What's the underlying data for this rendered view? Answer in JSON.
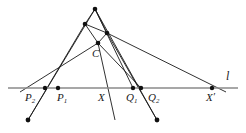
{
  "figure": {
    "kind": "projective-geometry-diagram",
    "width": 246,
    "height": 133,
    "background_color": "#ffffff",
    "stroke_color": "#1a1a1a",
    "axis_color": "#8a8a8a",
    "point_color": "#111111"
  },
  "labels": {
    "p2": {
      "base": "P",
      "sub": "2"
    },
    "p1": {
      "base": "P",
      "sub": "1"
    },
    "x": {
      "base": "X",
      "prime": ""
    },
    "q1": {
      "base": "Q",
      "sub": "1"
    },
    "q2": {
      "base": "Q",
      "sub": "2"
    },
    "x_prime": {
      "base": "X",
      "prime": "′"
    },
    "c": {
      "base": "C"
    },
    "line_l": {
      "base": "l"
    }
  },
  "points": [
    {
      "name": "apex",
      "x": 95,
      "y": 9,
      "labeled": false
    },
    {
      "name": "upper-left-node",
      "x": 85,
      "y": 24,
      "labeled": false
    },
    {
      "name": "right-node",
      "x": 107,
      "y": 33,
      "labeled": false
    },
    {
      "name": "center-c",
      "x": 98,
      "y": 43,
      "labeled": true,
      "label": "C"
    },
    {
      "name": "point-p2",
      "x": 45,
      "y": 88,
      "labeled": true,
      "label": "P2"
    },
    {
      "name": "point-p1",
      "x": 58,
      "y": 88,
      "labeled": true,
      "label": "P1"
    },
    {
      "name": "point-x",
      "x": 107,
      "y": 88,
      "labeled": true,
      "label": "X"
    },
    {
      "name": "point-q1",
      "x": 133,
      "y": 88,
      "labeled": true,
      "label": "Q1"
    },
    {
      "name": "point-q2",
      "x": 141,
      "y": 88,
      "labeled": true,
      "label": "Q2"
    },
    {
      "name": "point-x-prime",
      "x": 212,
      "y": 88,
      "labeled": true,
      "label": "X'"
    },
    {
      "name": "lower-left-vertex",
      "x": 28,
      "y": 120,
      "labeled": false
    },
    {
      "name": "lower-right-vertex",
      "x": 157,
      "y": 120,
      "labeled": false
    }
  ],
  "segments": [
    {
      "name": "apex-to-lower-left",
      "x1": 95,
      "y1": 9,
      "x2": 28,
      "y2": 120
    },
    {
      "name": "apex-to-lower-right",
      "x1": 95,
      "y1": 9,
      "x2": 157,
      "y2": 120
    },
    {
      "name": "apex-to-right-node",
      "x1": 95,
      "y1": 9,
      "x2": 107,
      "y2": 33
    },
    {
      "name": "apex-to-upper-left-node",
      "x1": 95,
      "y1": 9,
      "x2": 85,
      "y2": 24
    },
    {
      "name": "apex-to-q1",
      "x1": 95,
      "y1": 9,
      "x2": 133,
      "y2": 88
    },
    {
      "name": "upper-left-node-to-center",
      "x1": 85,
      "y1": 24,
      "x2": 98,
      "y2": 43
    },
    {
      "name": "upper-left-node-to-right-node",
      "x1": 85,
      "y1": 24,
      "x2": 107,
      "y2": 33
    },
    {
      "name": "upper-left-node-to-lower-left",
      "x1": 85,
      "y1": 24,
      "x2": 28,
      "y2": 120
    },
    {
      "name": "right-node-to-center",
      "x1": 107,
      "y1": 33,
      "x2": 98,
      "y2": 43
    },
    {
      "name": "right-node-to-lower-right",
      "x1": 107,
      "y1": 33,
      "x2": 157,
      "y2": 120
    },
    {
      "name": "right-node-to-x-prime",
      "x1": 107,
      "y1": 33,
      "x2": 226,
      "y2": 92
    },
    {
      "name": "center-to-p1",
      "x1": 98,
      "y1": 43,
      "x2": 20,
      "y2": 92
    },
    {
      "name": "center-to-q2",
      "x1": 98,
      "y1": 43,
      "x2": 141,
      "y2": 88
    },
    {
      "name": "center-to-below-x",
      "x1": 98,
      "y1": 43,
      "x2": 115,
      "y2": 120
    },
    {
      "name": "x-descending-ray",
      "x1": 107,
      "y1": 60,
      "x2": 113,
      "y2": 121
    },
    {
      "name": "axis-line-l",
      "x1": 8,
      "y1": 88,
      "x2": 238,
      "y2": 88
    }
  ]
}
